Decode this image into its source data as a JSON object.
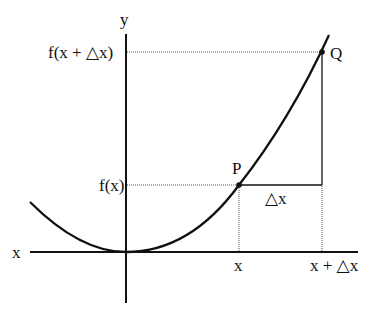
{
  "diagram": {
    "axes": {
      "x_label": "x",
      "y_label": "y"
    },
    "points": [
      {
        "name": "P",
        "label": "P"
      },
      {
        "name": "Q",
        "label": "Q"
      }
    ],
    "labels": {
      "fx": "f(x)",
      "fx_dx": "f(x + △x)",
      "x_tick": "x",
      "x_dx_tick": "x + △x",
      "delta_x": "△x"
    },
    "colors": {
      "ink": "#111111",
      "guide": "#555555",
      "background": "#ffffff"
    }
  }
}
